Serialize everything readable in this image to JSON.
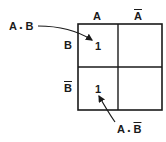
{
  "diagram": {
    "type": "karnaugh-map",
    "columns": [
      {
        "label": "A",
        "negated": false
      },
      {
        "label": "A",
        "negated": true
      }
    ],
    "rows": [
      {
        "label": "B",
        "negated": false
      },
      {
        "label": "B",
        "negated": true
      }
    ],
    "cells": [
      [
        "1",
        ""
      ],
      [
        "1",
        ""
      ]
    ],
    "annotations": [
      {
        "text_a": "A",
        "dot": "•",
        "text_b": "B",
        "negated_b": false,
        "points_to": "row0-col0"
      },
      {
        "text_a": "A",
        "dot": "•",
        "text_b": "B",
        "negated_b": true,
        "points_to": "row1-col0"
      }
    ],
    "line_color": "#1a1a1a"
  }
}
